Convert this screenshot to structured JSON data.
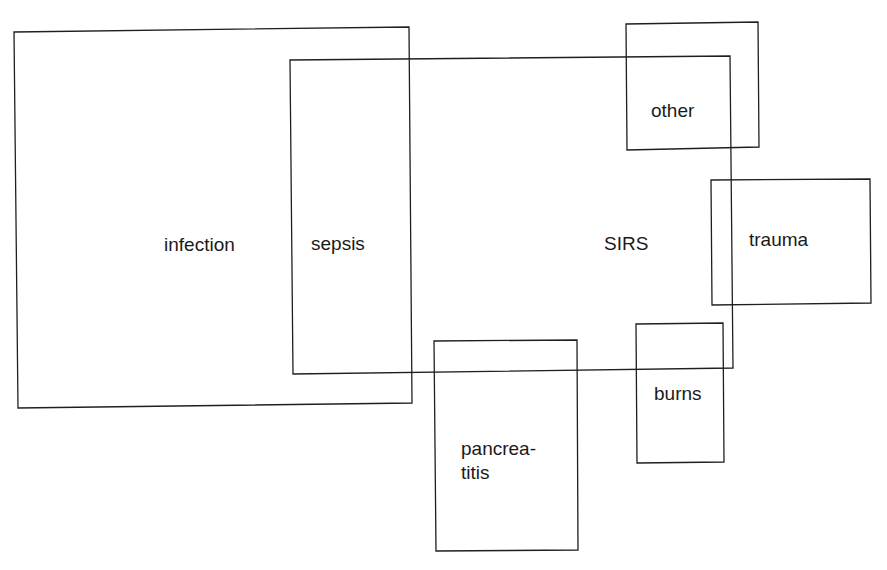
{
  "diagram": {
    "type": "overlapping-set-diagram",
    "stroke_color": "#1f1f1f",
    "text_color": "#1a1a1a",
    "background": "#ffffff",
    "sets": [
      {
        "id": "infection",
        "label": "infection"
      },
      {
        "id": "sirs",
        "label": "SIRS"
      },
      {
        "id": "sepsis",
        "label": "sepsis",
        "note": "intersection of infection and SIRS"
      },
      {
        "id": "other",
        "label": "other"
      },
      {
        "id": "trauma",
        "label": "trauma"
      },
      {
        "id": "burns",
        "label": "burns"
      },
      {
        "id": "pancreatitis",
        "label_line1": "pancrea-",
        "label_line2": "titis"
      }
    ]
  }
}
